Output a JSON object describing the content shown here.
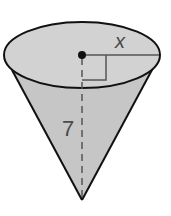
{
  "figure": {
    "type": "cone",
    "labels": {
      "radius": "x",
      "height": "7"
    },
    "colors": {
      "fill": "#c8c8c8",
      "top_fill": "#d3d3d3",
      "stroke": "#111111",
      "dimension_line": "#555555",
      "background": "#ffffff"
    }
  }
}
